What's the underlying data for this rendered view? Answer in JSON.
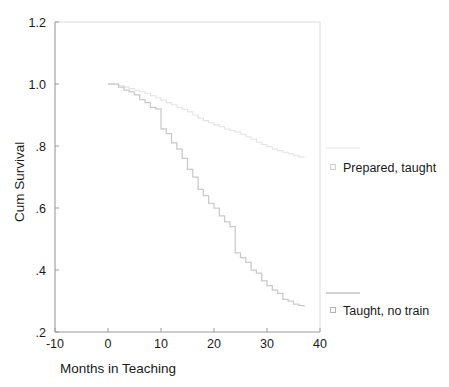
{
  "chart_data": {
    "type": "line",
    "title": "",
    "subtitle": "",
    "xlabel": "Months in Teaching",
    "ylabel": "Cum Survival",
    "xlim": [
      -10,
      40
    ],
    "ylim": [
      0.2,
      1.2
    ],
    "xticks": [
      -10,
      0,
      10,
      20,
      30,
      40
    ],
    "xticklabels": [
      "-10",
      "0",
      "10",
      "20",
      "30",
      "40"
    ],
    "yticks": [
      0.2,
      0.4,
      0.6,
      0.8,
      1.0,
      1.2
    ],
    "yticklabels": [
      ".2",
      ".4",
      ".6",
      ".8",
      "1.0",
      "1.2"
    ],
    "grid": false,
    "legend_position": "right",
    "line_color": "#c8c8c8",
    "axis_color": "#9a9a9a",
    "text_color": "#1a1a1a",
    "series": [
      {
        "name": "Prepared, taught",
        "marker": "square-open",
        "step": "post",
        "x": [
          0,
          1,
          2,
          3,
          4,
          5,
          6,
          7,
          8,
          9,
          10,
          11,
          12,
          13,
          14,
          15,
          16,
          17,
          18,
          19,
          20,
          21,
          22,
          23,
          24,
          25,
          26,
          27,
          28,
          29,
          30,
          31,
          32,
          33,
          34,
          35,
          36,
          37
        ],
        "y": [
          1.0,
          1.0,
          0.995,
          0.99,
          0.985,
          0.98,
          0.975,
          0.97,
          0.962,
          0.955,
          0.948,
          0.94,
          0.933,
          0.925,
          0.918,
          0.91,
          0.9,
          0.89,
          0.882,
          0.875,
          0.868,
          0.862,
          0.855,
          0.85,
          0.845,
          0.838,
          0.83,
          0.822,
          0.812,
          0.805,
          0.798,
          0.79,
          0.785,
          0.78,
          0.775,
          0.77,
          0.765,
          0.762
        ]
      },
      {
        "name": "Taught, no train",
        "marker": "square-open",
        "step": "post",
        "x": [
          0,
          1,
          2,
          3,
          4,
          5,
          6,
          7,
          8,
          9,
          10,
          11,
          12,
          13,
          14,
          15,
          16,
          17,
          18,
          19,
          20,
          21,
          22,
          23,
          24,
          25,
          26,
          27,
          28,
          29,
          30,
          31,
          32,
          33,
          34,
          35,
          36,
          37
        ],
        "y": [
          1.0,
          1.0,
          0.99,
          0.98,
          0.975,
          0.965,
          0.95,
          0.94,
          0.925,
          0.92,
          0.855,
          0.84,
          0.81,
          0.79,
          0.76,
          0.725,
          0.7,
          0.66,
          0.64,
          0.615,
          0.6,
          0.575,
          0.555,
          0.54,
          0.455,
          0.44,
          0.425,
          0.4,
          0.39,
          0.365,
          0.35,
          0.335,
          0.325,
          0.305,
          0.3,
          0.29,
          0.285,
          0.282
        ]
      }
    ]
  },
  "legend": {
    "entries": [
      {
        "label": "Prepared, taught",
        "marker": "square-open"
      },
      {
        "label": "Taught, no train",
        "marker": "square-open"
      }
    ]
  }
}
